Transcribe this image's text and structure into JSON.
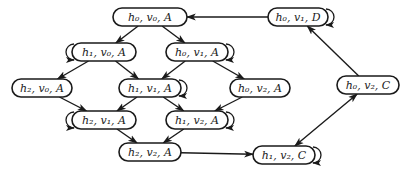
{
  "diagram": {
    "type": "state-transition-graph",
    "nodes": [
      {
        "id": "h0v0A",
        "label": "h₀, v₀, A",
        "cx": 150,
        "cy": 17,
        "w": 74,
        "self_loop": null
      },
      {
        "id": "h0v1D",
        "label": "h₀, v₁, D",
        "cx": 298,
        "cy": 17,
        "w": 60,
        "self_loop": "right"
      },
      {
        "id": "h1v0A",
        "label": "h₁, v₀, A",
        "cx": 104,
        "cy": 52,
        "w": 64,
        "self_loop": "left"
      },
      {
        "id": "h0v1A",
        "label": "h₀, v₁, A",
        "cx": 197,
        "cy": 52,
        "w": 62,
        "self_loop": "right"
      },
      {
        "id": "h2v0A",
        "label": "h₂, v₀, A",
        "cx": 42,
        "cy": 88,
        "w": 60,
        "self_loop": null
      },
      {
        "id": "h1v1A",
        "label": "h₁, v₁, A",
        "cx": 150,
        "cy": 88,
        "w": 62,
        "self_loop": "right"
      },
      {
        "id": "h0v2A",
        "label": "h₀, v₂, A",
        "cx": 260,
        "cy": 88,
        "w": 60,
        "self_loop": null
      },
      {
        "id": "h2v1A",
        "label": "h₂, v₁, A",
        "cx": 104,
        "cy": 120,
        "w": 64,
        "self_loop": "left"
      },
      {
        "id": "h1v2A",
        "label": "h₁, v₂, A",
        "cx": 197,
        "cy": 120,
        "w": 62,
        "self_loop": "right"
      },
      {
        "id": "h2v2A",
        "label": "h₂, v₂, A",
        "cx": 150,
        "cy": 152,
        "w": 62,
        "self_loop": null
      },
      {
        "id": "h1v2C",
        "label": "h₁, v₂, C",
        "cx": 284,
        "cy": 155,
        "w": 62,
        "self_loop": "right"
      },
      {
        "id": "h0v2C",
        "label": "h₀, v₂, C",
        "cx": 368,
        "cy": 85,
        "w": 62,
        "self_loop": null
      }
    ],
    "edges": [
      {
        "from": "h0v0A",
        "to": "h1v0A"
      },
      {
        "from": "h0v0A",
        "to": "h0v1A"
      },
      {
        "from": "h0v1D",
        "to": "h0v0A"
      },
      {
        "from": "h1v0A",
        "to": "h2v0A"
      },
      {
        "from": "h1v0A",
        "to": "h1v1A"
      },
      {
        "from": "h0v1A",
        "to": "h1v1A"
      },
      {
        "from": "h0v1A",
        "to": "h0v2A"
      },
      {
        "from": "h2v0A",
        "to": "h2v1A"
      },
      {
        "from": "h1v1A",
        "to": "h2v1A"
      },
      {
        "from": "h1v1A",
        "to": "h1v2A"
      },
      {
        "from": "h0v2A",
        "to": "h1v2A"
      },
      {
        "from": "h2v1A",
        "to": "h2v2A"
      },
      {
        "from": "h1v2A",
        "to": "h2v2A"
      },
      {
        "from": "h2v2A",
        "to": "h1v2C"
      },
      {
        "from": "h1v2C",
        "to": "h0v2C",
        "bidirectional": true
      },
      {
        "from": "h0v2C",
        "to": "h0v1D"
      }
    ]
  }
}
